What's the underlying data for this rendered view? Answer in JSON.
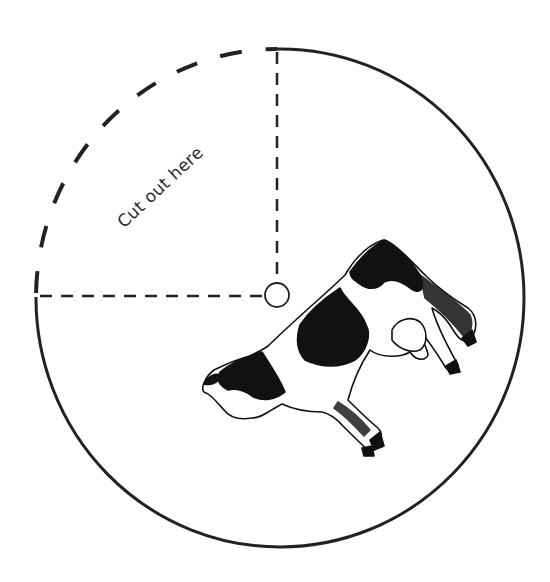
{
  "template": {
    "cut_label": "Cut out here",
    "illustration": "cow",
    "ink_color": "#222222",
    "background": "#ffffff"
  },
  "geometry": {
    "circle_center": [
      278,
      297
    ],
    "circle_radius": 246,
    "pin_hole_center": [
      277,
      295
    ],
    "pin_hole_radius": 12
  }
}
